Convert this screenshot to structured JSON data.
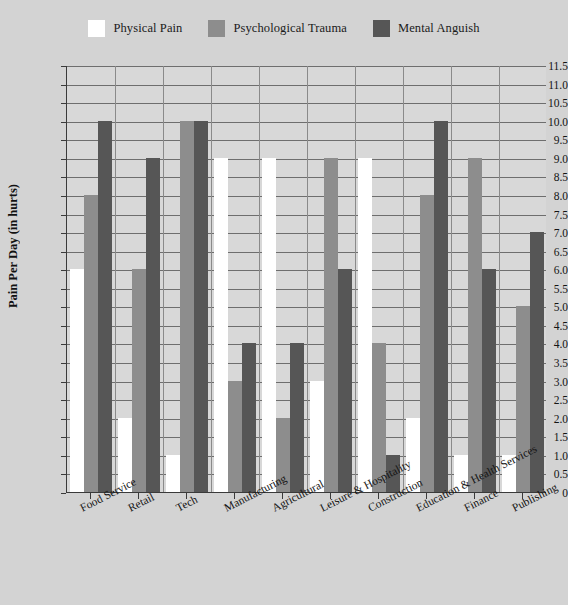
{
  "chart_data": {
    "type": "bar",
    "title": "",
    "xlabel": "",
    "ylabel": "Pain Per Day (in hurts)",
    "ylim": [
      0,
      11.5
    ],
    "grid": true,
    "legend_position": "top-center",
    "categories": [
      "Food Service",
      "Retail",
      "Tech",
      "Manufacturing",
      "Agricultural",
      "Leisure & Hospitality",
      "Construction",
      "Education & Health Services",
      "Finance",
      "Publishing"
    ],
    "ytick_labels": [
      "11.5",
      "11.0",
      "10.5",
      "10.0",
      "9.5",
      "9.0",
      "8.5",
      "8.0",
      "7.5",
      "7.0",
      "6.5",
      "6.0",
      "5.5",
      "5.0",
      "4.5",
      "4.0",
      "3.5",
      "3.0",
      "2.5",
      "2.0",
      "1.5",
      "1.0",
      "0.5",
      "0"
    ],
    "ytick_values": [
      11.5,
      11.0,
      10.5,
      10.0,
      9.5,
      9.0,
      8.5,
      8.0,
      7.5,
      7.0,
      6.5,
      6.0,
      5.5,
      5.0,
      4.5,
      4.0,
      3.5,
      3.0,
      2.5,
      2.0,
      1.5,
      1.0,
      0.5,
      0
    ],
    "series": [
      {
        "name": "Physical Pain",
        "color": "#ffffff",
        "values": [
          6,
          2,
          1,
          9,
          9,
          3,
          9,
          2,
          1,
          1
        ]
      },
      {
        "name": "Psychological Trauma",
        "color": "#8d8d8d",
        "values": [
          8,
          6,
          10,
          3,
          2,
          9,
          4,
          8,
          9,
          5
        ]
      },
      {
        "name": "Mental Anguish",
        "color": "#565656",
        "values": [
          10,
          9,
          10,
          4,
          4,
          6,
          1,
          10,
          6,
          7
        ]
      }
    ]
  },
  "colors": {
    "background": "#d3d3d3",
    "plot_background": "#d8d8d8",
    "axis": "#3a3a3a",
    "grid": "#6e6e6e",
    "text": "#141414"
  }
}
